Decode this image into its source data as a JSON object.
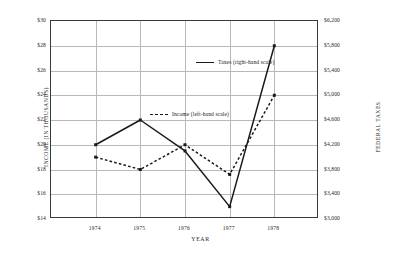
{
  "chart_data": {
    "type": "line",
    "title": "",
    "xlabel": "YEAR",
    "ylabel": "INCOME (IN THOUSANDS)",
    "ylabel_right": "FEDERAL TAXES",
    "categories": [
      "1974",
      "1975",
      "1976",
      "1977",
      "1978"
    ],
    "x": [
      1974,
      1975,
      1976,
      1977,
      1978
    ],
    "ylim": [
      14,
      30
    ],
    "ylim_right": [
      3000,
      6200
    ],
    "yticks": [
      "$14",
      "$16",
      "$18",
      "$20",
      "$22",
      "$24",
      "$26",
      "$28",
      "$30"
    ],
    "ytick_values": [
      14,
      16,
      18,
      20,
      22,
      24,
      26,
      28,
      30
    ],
    "yticks_right": [
      "$3,000",
      "$3,400",
      "$3,800",
      "$4,200",
      "$4,600",
      "$5,000",
      "$5,400",
      "$5,800",
      "$6,200"
    ],
    "ytick_values_right": [
      3000,
      3400,
      3800,
      4200,
      4600,
      5000,
      5400,
      5800,
      6200
    ],
    "grid": true,
    "legend_position": "inside-upper-center",
    "series": [
      {
        "name": "Taxes (right-hand scale)",
        "axis": "right",
        "style": "solid",
        "color": "#1a1a1a",
        "values": [
          4200,
          4600,
          4100,
          3200,
          5800
        ]
      },
      {
        "name": "Income (left-hand scale)",
        "axis": "left",
        "style": "dashed",
        "color": "#1a1a1a",
        "values": [
          19.0,
          18.0,
          20.0,
          17.6,
          24.0
        ]
      }
    ]
  },
  "legend": {
    "taxes_label": "Taxes (right-hand scale)",
    "income_label": "Income (left-hand scale)"
  }
}
